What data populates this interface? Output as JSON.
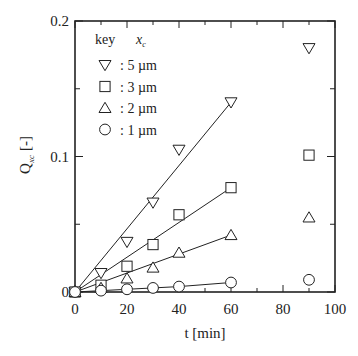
{
  "chart_data": {
    "type": "scatter",
    "title": "",
    "xlabel": "t [min]",
    "ylabel": "Q",
    "ylabel_subscript": "xc",
    "ylabel_unit": "[-]",
    "xlim": [
      0,
      100
    ],
    "ylim": [
      0,
      0.2
    ],
    "xticks": [
      0,
      20,
      40,
      60,
      80,
      100
    ],
    "xtick_labels": [
      "0",
      "20",
      "40",
      "60",
      "80",
      "100"
    ],
    "xminor_step": 10,
    "yticks": [
      0,
      0.1,
      0.2
    ],
    "ytick_labels": [
      "0",
      "0.1",
      "0.2"
    ],
    "yminor_step": 0.05,
    "grid": false,
    "legend": {
      "position": "upper-left",
      "header_key": "key",
      "header_var": "x",
      "header_var_sub": "c"
    },
    "series": [
      {
        "name": "5 µm",
        "label": ": 5 µm",
        "marker": "triangle-down",
        "x": [
          0,
          10,
          20,
          30,
          40,
          60,
          90
        ],
        "y": [
          0,
          0.014,
          0.037,
          0.066,
          0.105,
          0.14,
          0.18
        ],
        "fit_line": {
          "x": [
            0,
            60
          ],
          "y": [
            0,
            0.14
          ]
        }
      },
      {
        "name": "3 µm",
        "label": ": 3 µm",
        "marker": "square",
        "x": [
          0,
          10,
          20,
          30,
          40,
          60,
          90
        ],
        "y": [
          0,
          0.005,
          0.019,
          0.035,
          0.057,
          0.077,
          0.101
        ],
        "fit_line": {
          "x": [
            0,
            60
          ],
          "y": [
            0,
            0.077
          ]
        }
      },
      {
        "name": "2 µm",
        "label": ": 2 µm",
        "marker": "triangle-up",
        "x": [
          0,
          10,
          20,
          30,
          40,
          60,
          90
        ],
        "y": [
          0,
          0.003,
          0.01,
          0.018,
          0.029,
          0.042,
          0.055
        ],
        "fit_line": {
          "x": [
            0,
            60
          ],
          "y": [
            0,
            0.042
          ]
        }
      },
      {
        "name": "1 µm",
        "label": ": 1 µm",
        "marker": "circle",
        "x": [
          0,
          10,
          20,
          30,
          40,
          60,
          90
        ],
        "y": [
          0,
          0.001,
          0.002,
          0.003,
          0.004,
          0.007,
          0.009
        ],
        "fit_line": {
          "x": [
            0,
            20,
            30,
            40,
            60
          ],
          "y": [
            0,
            0.002,
            0.003,
            0.004,
            0.007
          ]
        }
      }
    ]
  },
  "colors": {
    "ink": "#222222",
    "background": "#ffffff"
  }
}
